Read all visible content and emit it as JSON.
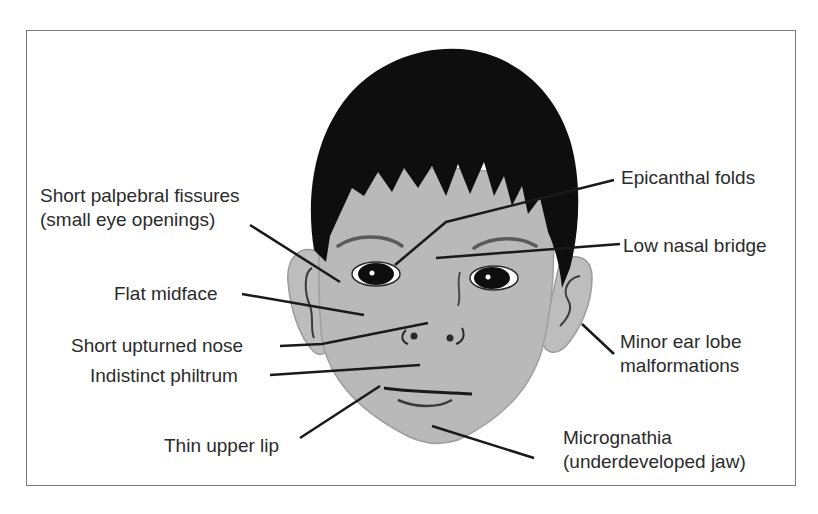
{
  "figure": {
    "colors": {
      "skin": "#b9b9b9",
      "hair": "#0e0e0e",
      "outline": "#3a3a3a",
      "leader": "#1a1a1a",
      "text": "#2b2b2b",
      "frame": "#7a7a7a"
    }
  },
  "labels": {
    "palpebral": {
      "line1": "Short palpebral fissures",
      "line2": "(small eye openings)"
    },
    "epicanthal": {
      "line1": "Epicanthal folds"
    },
    "nasal_bridge": {
      "line1": "Low nasal bridge"
    },
    "midface": {
      "line1": "Flat midface"
    },
    "nose": {
      "line1": "Short upturned nose"
    },
    "philtrum": {
      "line1": "Indistinct philtrum"
    },
    "ear": {
      "line1": "Minor ear lobe",
      "line2": "malformations"
    },
    "lip": {
      "line1": "Thin upper lip"
    },
    "jaw": {
      "line1": "Micrognathia",
      "line2": "(underdeveloped jaw)"
    }
  }
}
